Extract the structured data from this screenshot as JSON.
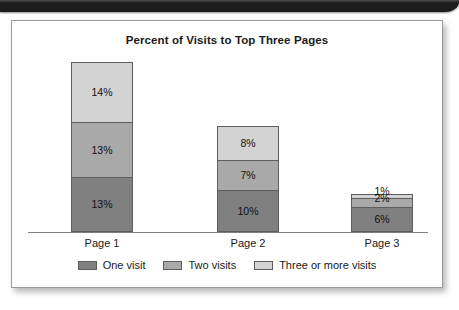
{
  "scan": {
    "top_band_name": "scanned-page-edge"
  },
  "chart_data": {
    "type": "bar",
    "stacked": true,
    "title": "Percent of Visits to Top Three Pages",
    "xlabel": "",
    "ylabel": "",
    "categories": [
      "Page 1",
      "Page 2",
      "Page 3"
    ],
    "series": [
      {
        "name": "One visit",
        "color": "#808080",
        "values": [
          13,
          10,
          6
        ],
        "labels": [
          "13%",
          "10%",
          "6%"
        ]
      },
      {
        "name": "Two visits",
        "color": "#a9a9a9",
        "values": [
          13,
          7,
          2
        ],
        "labels": [
          "13%",
          "7%",
          "2%"
        ]
      },
      {
        "name": "Three or more visits",
        "color": "#d3d3d3",
        "values": [
          14,
          8,
          1
        ],
        "labels": [
          "14%",
          "8%",
          "1%"
        ]
      }
    ],
    "totals": [
      40,
      25,
      9
    ],
    "ylim": [
      0,
      42
    ],
    "grid": false,
    "legend_position": "bottom"
  }
}
